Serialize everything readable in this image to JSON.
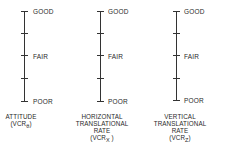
{
  "scale_levels": [
    "GOOD",
    "FAIR",
    "POOR"
  ],
  "scales": [
    {
      "name": "attitude",
      "axis_x": 24,
      "caption_lines": [
        "ATTITUDE"
      ],
      "caption_sub_prefix": "(VCR",
      "caption_sub": "θ",
      "caption_sub_suffix": ")"
    },
    {
      "name": "horizontal-translational-rate",
      "axis_x": 100,
      "caption_lines": [
        "HORIZONTAL",
        "TRANSLATIONAL",
        "RATE"
      ],
      "caption_sub_prefix": "(VCR",
      "caption_sub": "X",
      "caption_sub_suffix": " )"
    },
    {
      "name": "vertical-translational-rate",
      "axis_x": 176,
      "caption_lines": [
        "VERTICAL",
        "TRANSLATIONAL",
        "RATE"
      ],
      "caption_sub_prefix": "(VCR",
      "caption_sub": "Z",
      "caption_sub_suffix": ")"
    }
  ],
  "labels": {
    "good": "GOOD",
    "fair": "FAIR",
    "poor": "POOR"
  },
  "captions": {
    "attitude": "ATTITUDE",
    "horizontal_1": "HORIZONTAL",
    "horizontal_2": "TRANSLATIONAL",
    "horizontal_3": "RATE",
    "vertical_1": "VERTICAL",
    "vertical_2": "TRANSLATIONAL",
    "vertical_3": "RATE",
    "vcr_prefix": "(VCR",
    "sub_theta": "θ",
    "sub_x": "X",
    "sub_z": "Z",
    "close": ")",
    "close_spaced": " )"
  }
}
